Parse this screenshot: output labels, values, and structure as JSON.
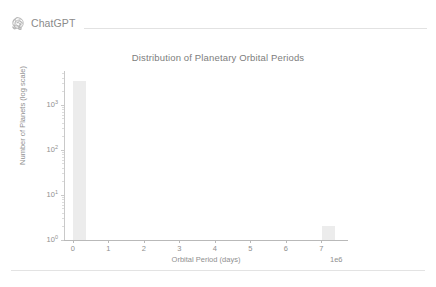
{
  "header": {
    "brand_name": "ChatGPT",
    "logo_icon": "chatgpt-logo-icon"
  },
  "chart_data": {
    "type": "bar",
    "title": "Distribution of Planetary Orbital Periods",
    "xlabel": "Orbital Period (days)",
    "ylabel": "Number of Planets (log scale)",
    "x_offset_text": "1e6",
    "xlim": [
      -250000.0,
      7750000.0
    ],
    "ylim": [
      1,
      5623
    ],
    "yscale": "log",
    "grid": false,
    "legend": null,
    "bar_color": "#ececec",
    "x_tick_values": [
      0,
      1,
      2,
      3,
      4,
      5,
      6,
      7
    ],
    "x_tick_labels": [
      "0",
      "1",
      "2",
      "3",
      "4",
      "5",
      "6",
      "7"
    ],
    "y_tick_values": [
      1,
      10,
      100,
      1000
    ],
    "y_tick_labels": [
      "10⁰",
      "10¹",
      "10²",
      "10³"
    ],
    "y_tick_mantissas": [
      "10",
      "10",
      "10",
      "10"
    ],
    "y_tick_exponents": [
      "0",
      "1",
      "2",
      "3"
    ],
    "bins": [
      {
        "x_center": 180000.0,
        "x_left": 0.0,
        "x_right": 360000.0,
        "value": 3400
      },
      {
        "x_center": 7200000.0,
        "x_left": 7020000.0,
        "x_right": 7380000.0,
        "value": 2
      }
    ],
    "values": [
      3400,
      2
    ],
    "categories": [
      "0.18e6",
      "7.2e6"
    ]
  }
}
